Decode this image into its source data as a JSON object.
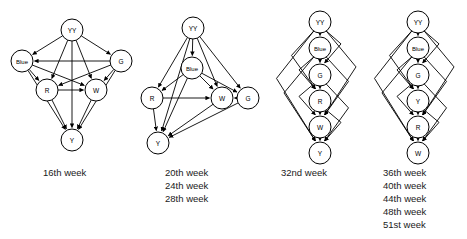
{
  "figure": {
    "type": "directed-graph-series",
    "width": 467,
    "height": 239,
    "background_color": "#ffffff",
    "line_color": "#000000",
    "node_fill": "#ffffff"
  },
  "graphs": [
    {
      "id": "graph-16th-week",
      "caption": [
        "16th week"
      ],
      "caption_x": 43,
      "caption_y": 176,
      "node_radius": 11,
      "nodes": [
        {
          "id": "YY",
          "label": "YY",
          "x": 72,
          "y": 30
        },
        {
          "id": "Blue",
          "label": "Blue",
          "x": 22,
          "y": 61
        },
        {
          "id": "G",
          "label": "G",
          "x": 121,
          "y": 61
        },
        {
          "id": "R",
          "label": "R",
          "x": 47,
          "y": 90
        },
        {
          "id": "W",
          "label": "W",
          "x": 96,
          "y": 90
        },
        {
          "id": "Y",
          "label": "Y",
          "x": 72,
          "y": 140
        }
      ],
      "edges": [
        {
          "from": "YY",
          "to": "Blue"
        },
        {
          "from": "YY",
          "to": "G"
        },
        {
          "from": "YY",
          "to": "R"
        },
        {
          "from": "YY",
          "to": "W"
        },
        {
          "from": "YY",
          "to": "Y"
        },
        {
          "from": "G",
          "to": "Blue"
        },
        {
          "from": "G",
          "to": "R"
        },
        {
          "from": "G",
          "to": "W"
        },
        {
          "from": "G",
          "to": "Y"
        },
        {
          "from": "Blue",
          "to": "R"
        },
        {
          "from": "Blue",
          "to": "W"
        },
        {
          "from": "Blue",
          "to": "Y"
        },
        {
          "from": "R",
          "to": "W"
        },
        {
          "from": "R",
          "to": "Y"
        },
        {
          "from": "W",
          "to": "Y"
        }
      ]
    },
    {
      "id": "graph-20-24-28th-week",
      "caption": [
        "20th week",
        "24th week",
        "28th week"
      ],
      "caption_x": 165,
      "caption_y": 176,
      "node_radius": 11,
      "nodes": [
        {
          "id": "YY",
          "label": "YY",
          "x": 193,
          "y": 28
        },
        {
          "id": "Blue",
          "label": "Blue",
          "x": 192,
          "y": 68
        },
        {
          "id": "R",
          "label": "R",
          "x": 152,
          "y": 98
        },
        {
          "id": "W",
          "label": "W",
          "x": 222,
          "y": 98
        },
        {
          "id": "G",
          "label": "G",
          "x": 248,
          "y": 98
        },
        {
          "id": "Y",
          "label": "Y",
          "x": 158,
          "y": 143
        }
      ],
      "edges": [
        {
          "from": "YY",
          "to": "Blue"
        },
        {
          "from": "YY",
          "to": "R"
        },
        {
          "from": "YY",
          "to": "W"
        },
        {
          "from": "YY",
          "to": "G"
        },
        {
          "from": "YY",
          "to": "Y"
        },
        {
          "from": "Blue",
          "to": "R"
        },
        {
          "from": "Blue",
          "to": "W"
        },
        {
          "from": "Blue",
          "to": "G"
        },
        {
          "from": "Blue",
          "to": "Y"
        },
        {
          "from": "R",
          "to": "W"
        },
        {
          "from": "R",
          "to": "Y"
        },
        {
          "from": "W",
          "to": "Y"
        },
        {
          "from": "G",
          "to": "Y"
        },
        {
          "from": "G",
          "to": "W"
        }
      ]
    },
    {
      "id": "graph-32nd-week",
      "caption": [
        "32nd week"
      ],
      "caption_x": 281,
      "caption_y": 176,
      "node_radius": 11,
      "chain": [
        "YY",
        "Blue",
        "G",
        "R",
        "W",
        "Y"
      ],
      "nodes": [
        {
          "id": "YY",
          "label": "YY",
          "x": 320,
          "y": 22
        },
        {
          "id": "Blue",
          "label": "Blue",
          "x": 320,
          "y": 48
        },
        {
          "id": "G",
          "label": "G",
          "x": 320,
          "y": 75
        },
        {
          "id": "R",
          "label": "R",
          "x": 320,
          "y": 101
        },
        {
          "id": "W",
          "label": "W",
          "x": 320,
          "y": 127
        },
        {
          "id": "Y",
          "label": "Y",
          "x": 320,
          "y": 153
        }
      ],
      "edges": [
        {
          "from": "YY",
          "to": "Blue"
        },
        {
          "from": "YY",
          "to": "G"
        },
        {
          "from": "YY",
          "to": "R"
        },
        {
          "from": "YY",
          "to": "W"
        },
        {
          "from": "YY",
          "to": "Y"
        },
        {
          "from": "Blue",
          "to": "G"
        },
        {
          "from": "Blue",
          "to": "R"
        },
        {
          "from": "Blue",
          "to": "W"
        },
        {
          "from": "Blue",
          "to": "Y"
        },
        {
          "from": "G",
          "to": "R"
        },
        {
          "from": "G",
          "to": "W"
        },
        {
          "from": "G",
          "to": "Y"
        },
        {
          "from": "R",
          "to": "W"
        },
        {
          "from": "R",
          "to": "Y"
        },
        {
          "from": "W",
          "to": "Y"
        }
      ]
    },
    {
      "id": "graph-36-40-44-48-51st-week",
      "caption": [
        "36th week",
        "40th week",
        "44th week",
        "48th week",
        "51st week"
      ],
      "caption_x": 383,
      "caption_y": 176,
      "node_radius": 11,
      "chain": [
        "YY",
        "Blue",
        "G",
        "Y",
        "R",
        "W"
      ],
      "nodes": [
        {
          "id": "YY",
          "label": "YY",
          "x": 418,
          "y": 22
        },
        {
          "id": "Blue",
          "label": "Blue",
          "x": 418,
          "y": 48
        },
        {
          "id": "G",
          "label": "G",
          "x": 418,
          "y": 75
        },
        {
          "id": "Y",
          "label": "Y",
          "x": 418,
          "y": 101
        },
        {
          "id": "R",
          "label": "R",
          "x": 418,
          "y": 127
        },
        {
          "id": "W",
          "label": "W",
          "x": 418,
          "y": 153
        }
      ],
      "edges": [
        {
          "from": "YY",
          "to": "Blue"
        },
        {
          "from": "YY",
          "to": "G"
        },
        {
          "from": "YY",
          "to": "Y"
        },
        {
          "from": "YY",
          "to": "R"
        },
        {
          "from": "YY",
          "to": "W"
        },
        {
          "from": "Blue",
          "to": "G"
        },
        {
          "from": "Blue",
          "to": "Y"
        },
        {
          "from": "Blue",
          "to": "R"
        },
        {
          "from": "Blue",
          "to": "W"
        },
        {
          "from": "G",
          "to": "Y"
        },
        {
          "from": "G",
          "to": "R"
        },
        {
          "from": "G",
          "to": "W"
        },
        {
          "from": "Y",
          "to": "R"
        },
        {
          "from": "Y",
          "to": "W"
        },
        {
          "from": "R",
          "to": "W"
        }
      ]
    }
  ]
}
